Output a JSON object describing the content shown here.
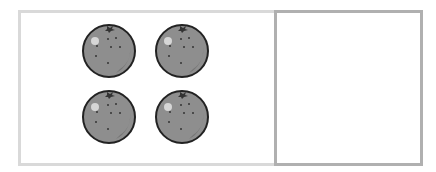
{
  "figure": {
    "left_box": {
      "item": "orange",
      "count": 4,
      "border_color": "#d9d9d9"
    },
    "right_box": {
      "count": 0,
      "border_color": "#b0b0b0"
    },
    "fruit_color": "#8c8c8c",
    "fruits": [
      {
        "x": 80,
        "y": 21
      },
      {
        "x": 153,
        "y": 21
      },
      {
        "x": 80,
        "y": 87
      },
      {
        "x": 153,
        "y": 87
      }
    ]
  }
}
